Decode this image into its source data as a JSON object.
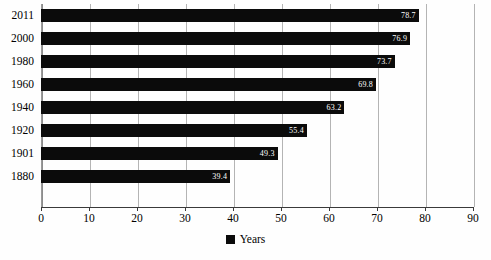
{
  "chart_data": {
    "type": "bar",
    "orientation": "horizontal",
    "title": "",
    "xlabel": "",
    "ylabel": "",
    "categories": [
      "2011",
      "2000",
      "1980",
      "1960",
      "1940",
      "1920",
      "1901",
      "1880"
    ],
    "values": [
      78.7,
      76.9,
      73.7,
      69.8,
      63.2,
      55.4,
      49.3,
      39.4
    ],
    "value_labels": [
      "78.7",
      "76.9",
      "73.7",
      "69.8",
      "63.2",
      "55.4",
      "49.3",
      "39.4"
    ],
    "series": [
      {
        "name": "Years",
        "values": [
          78.7,
          76.9,
          73.7,
          69.8,
          63.2,
          55.4,
          49.3,
          39.4
        ],
        "color": "#0b0b0b"
      }
    ],
    "xlim": [
      0,
      90
    ],
    "xticks": [
      0,
      10,
      20,
      30,
      40,
      50,
      60,
      70,
      80,
      90
    ],
    "xtick_labels": [
      "0",
      "10",
      "20",
      "30",
      "40",
      "50",
      "60",
      "70",
      "80",
      "90"
    ],
    "grid": "vertical",
    "legend": {
      "position": "bottom",
      "entries": [
        {
          "label": "Years",
          "color": "#0b0b0b",
          "marker": "square"
        }
      ]
    },
    "colors": {
      "bar": "#0b0b0b",
      "gridline": "#b4b4b4",
      "axis": "#3a3a3a",
      "value_label": "#ffffff",
      "background": "#fefefe"
    }
  }
}
